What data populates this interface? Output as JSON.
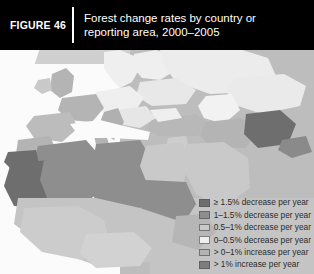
{
  "header": {
    "figure_tag": "FIGURE 46",
    "title_line1": "Forest change rates by country or",
    "title_line2": "reporting area, 2000–2005",
    "background_color": "#000000",
    "text_color": "#ffffff"
  },
  "legend": {
    "items": [
      {
        "label": "≥ 1.5% decrease per year",
        "color": "#6e6e6e"
      },
      {
        "label": "1–1.5% decrease per year",
        "color": "#8e8e8e"
      },
      {
        "label": "0.5–1% decrease per year",
        "color": "#c9c9c9"
      },
      {
        "label": "0–0.5% decrease per year",
        "color": "#efefef"
      },
      {
        "label": "> 0–1% increase per year",
        "color": "#b4b4b4"
      },
      {
        "label": "> 1% increase per year",
        "color": "#7d7d7d"
      }
    ]
  },
  "map": {
    "ocean_color": "#fbfbfb",
    "backdrop_color": "#b9b9b9",
    "no_data_color": "#d8d8d8",
    "projection_note": "Europe, North Africa, Middle East and Central Asia",
    "regions": [
      {
        "name": "mauritania",
        "class_index": 0,
        "color": "#6e6e6e"
      },
      {
        "name": "western-sahara",
        "class_index": 0,
        "color": "#6e6e6e"
      },
      {
        "name": "morocco",
        "class_index": 4,
        "color": "#b4b4b4"
      },
      {
        "name": "algeria",
        "class_index": 1,
        "color": "#8e8e8e"
      },
      {
        "name": "tunisia",
        "class_index": 4,
        "color": "#b4b4b4"
      },
      {
        "name": "libya",
        "class_index": 1,
        "color": "#8e8e8e"
      },
      {
        "name": "egypt",
        "class_index": 2,
        "color": "#c9c9c9"
      },
      {
        "name": "mali",
        "class_index": 1,
        "color": "#8e8e8e"
      },
      {
        "name": "niger",
        "class_index": 1,
        "color": "#8e8e8e"
      },
      {
        "name": "sahel-belt",
        "class_index": 2,
        "color": "#c9c9c9"
      },
      {
        "name": "west-africa",
        "class_index": 2,
        "color": "#c9c9c9"
      },
      {
        "name": "iberia",
        "class_index": 4,
        "color": "#b4b4b4"
      },
      {
        "name": "france",
        "class_index": 4,
        "color": "#b4b4b4"
      },
      {
        "name": "british-isles",
        "class_index": 4,
        "color": "#b4b4b4"
      },
      {
        "name": "scandinavia",
        "class_index": 3,
        "color": "#efefef"
      },
      {
        "name": "central-europe",
        "class_index": 3,
        "color": "#efefef"
      },
      {
        "name": "italy",
        "class_index": 4,
        "color": "#b4b4b4"
      },
      {
        "name": "balkans",
        "class_index": 3,
        "color": "#efefef"
      },
      {
        "name": "turkey",
        "class_index": 4,
        "color": "#b4b4b4"
      },
      {
        "name": "russia-west",
        "class_index": 3,
        "color": "#efefef"
      },
      {
        "name": "ukraine-belarus",
        "class_index": 3,
        "color": "#efefef"
      },
      {
        "name": "kazakhstan",
        "class_index": 3,
        "color": "#efefef"
      },
      {
        "name": "caspian-region",
        "class_index": 3,
        "color": "#efefef"
      },
      {
        "name": "iran",
        "class_index": 4,
        "color": "#b4b4b4"
      },
      {
        "name": "afghanistan",
        "class_index": 0,
        "color": "#6e6e6e"
      },
      {
        "name": "arabian-peninsula",
        "class_index": 2,
        "color": "#c9c9c9"
      },
      {
        "name": "levant",
        "class_index": 2,
        "color": "#c9c9c9"
      },
      {
        "name": "sudan",
        "class_index": 1,
        "color": "#8e8e8e"
      }
    ]
  }
}
